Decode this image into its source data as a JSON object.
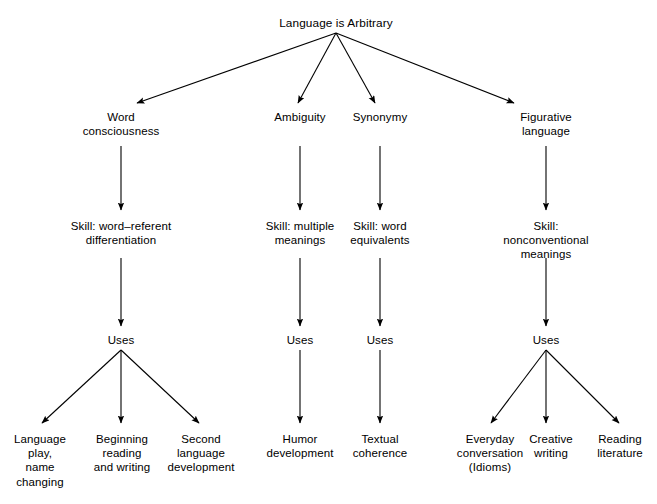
{
  "diagram": {
    "type": "hierarchy-tree",
    "title": "Language is Arbitrary",
    "background_color": "#ffffff",
    "line_color": "#000000",
    "text_color": "#000000",
    "levels": [
      "root",
      "concept",
      "skill",
      "uses",
      "application"
    ],
    "nodes": {
      "root": {
        "label": "Language is Arbitrary",
        "x": 336,
        "y": 16
      },
      "concepts": [
        {
          "id": "word-consciousness",
          "label": "Word\nconsciousness",
          "x": 121,
          "y": 110
        },
        {
          "id": "ambiguity",
          "label": "Ambiguity",
          "x": 300,
          "y": 110
        },
        {
          "id": "synonymy",
          "label": "Synonymy",
          "x": 380,
          "y": 110
        },
        {
          "id": "figurative-language",
          "label": "Figurative\nlanguage",
          "x": 546,
          "y": 110
        }
      ],
      "skills": [
        {
          "id": "skill-word-referent",
          "label": "Skill: word–referent\ndifferentiation",
          "x": 121,
          "y": 219
        },
        {
          "id": "skill-multiple-meanings",
          "label": "Skill: multiple\nmeanings",
          "x": 300,
          "y": 219
        },
        {
          "id": "skill-word-equivalents",
          "label": "Skill: word\nequivalents",
          "x": 380,
          "y": 219
        },
        {
          "id": "skill-nonconventional",
          "label": "Skill: nonconventional\nmeanings",
          "x": 546,
          "y": 219
        }
      ],
      "uses": [
        {
          "id": "uses-word-consciousness",
          "label": "Uses",
          "x": 121,
          "y": 333
        },
        {
          "id": "uses-ambiguity",
          "label": "Uses",
          "x": 300,
          "y": 333
        },
        {
          "id": "uses-synonymy",
          "label": "Uses",
          "x": 380,
          "y": 333
        },
        {
          "id": "uses-figurative-language",
          "label": "Uses",
          "x": 546,
          "y": 333
        }
      ],
      "applications": [
        {
          "id": "language-play",
          "label": "Language\nplay,\nname\nchanging",
          "x": 40,
          "y": 432
        },
        {
          "id": "beginning-reading",
          "label": "Beginning\nreading\nand writing",
          "x": 122,
          "y": 432
        },
        {
          "id": "second-language",
          "label": "Second\nlanguage\ndevelopment",
          "x": 201,
          "y": 432
        },
        {
          "id": "humor-development",
          "label": "Humor\ndevelopment",
          "x": 300,
          "y": 432
        },
        {
          "id": "textual-coherence",
          "label": "Textual\ncoherence",
          "x": 380,
          "y": 432
        },
        {
          "id": "everyday-conversation",
          "label": "Everyday\nconversation\n(Idioms)",
          "x": 490,
          "y": 432
        },
        {
          "id": "creative-writing",
          "label": "Creative\nwriting",
          "x": 551,
          "y": 432
        },
        {
          "id": "reading-literature",
          "label": "Reading\nliterature",
          "x": 620,
          "y": 432
        }
      ]
    },
    "edges": [
      {
        "from": "root",
        "to": "word-consciousness",
        "x1": 336,
        "y1": 33,
        "x2": 137,
        "y2": 103
      },
      {
        "from": "root",
        "to": "ambiguity",
        "x1": 336,
        "y1": 33,
        "x2": 298,
        "y2": 103
      },
      {
        "from": "root",
        "to": "synonymy",
        "x1": 336,
        "y1": 33,
        "x2": 375,
        "y2": 103
      },
      {
        "from": "root",
        "to": "figurative-language",
        "x1": 336,
        "y1": 33,
        "x2": 514,
        "y2": 103
      },
      {
        "from": "word-consciousness",
        "to": "skill-word-referent",
        "x1": 121,
        "y1": 146,
        "x2": 121,
        "y2": 210
      },
      {
        "from": "ambiguity",
        "to": "skill-multiple-meanings",
        "x1": 300,
        "y1": 146,
        "x2": 300,
        "y2": 210
      },
      {
        "from": "synonymy",
        "to": "skill-word-equivalents",
        "x1": 380,
        "y1": 146,
        "x2": 380,
        "y2": 210
      },
      {
        "from": "figurative-language",
        "to": "skill-nonconventional",
        "x1": 546,
        "y1": 146,
        "x2": 546,
        "y2": 210
      },
      {
        "from": "skill-word-referent",
        "to": "uses-word-consciousness",
        "x1": 121,
        "y1": 258,
        "x2": 121,
        "y2": 326
      },
      {
        "from": "skill-multiple-meanings",
        "to": "uses-ambiguity",
        "x1": 300,
        "y1": 258,
        "x2": 300,
        "y2": 326
      },
      {
        "from": "skill-word-equivalents",
        "to": "uses-synonymy",
        "x1": 380,
        "y1": 258,
        "x2": 380,
        "y2": 326
      },
      {
        "from": "skill-nonconventional",
        "to": "uses-figurative-language",
        "x1": 546,
        "y1": 258,
        "x2": 546,
        "y2": 326
      },
      {
        "from": "uses-word-consciousness",
        "to": "language-play",
        "x1": 121,
        "y1": 350,
        "x2": 42,
        "y2": 423
      },
      {
        "from": "uses-word-consciousness",
        "to": "beginning-reading",
        "x1": 121,
        "y1": 350,
        "x2": 121,
        "y2": 423
      },
      {
        "from": "uses-word-consciousness",
        "to": "second-language",
        "x1": 121,
        "y1": 350,
        "x2": 199,
        "y2": 423
      },
      {
        "from": "uses-ambiguity",
        "to": "humor-development",
        "x1": 300,
        "y1": 350,
        "x2": 300,
        "y2": 423
      },
      {
        "from": "uses-synonymy",
        "to": "textual-coherence",
        "x1": 380,
        "y1": 350,
        "x2": 380,
        "y2": 423
      },
      {
        "from": "uses-figurative-language",
        "to": "everyday-conversation",
        "x1": 546,
        "y1": 350,
        "x2": 491,
        "y2": 423
      },
      {
        "from": "uses-figurative-language",
        "to": "creative-writing",
        "x1": 546,
        "y1": 350,
        "x2": 546,
        "y2": 423
      },
      {
        "from": "uses-figurative-language",
        "to": "reading-literature",
        "x1": 546,
        "y1": 350,
        "x2": 619,
        "y2": 423
      }
    ]
  }
}
